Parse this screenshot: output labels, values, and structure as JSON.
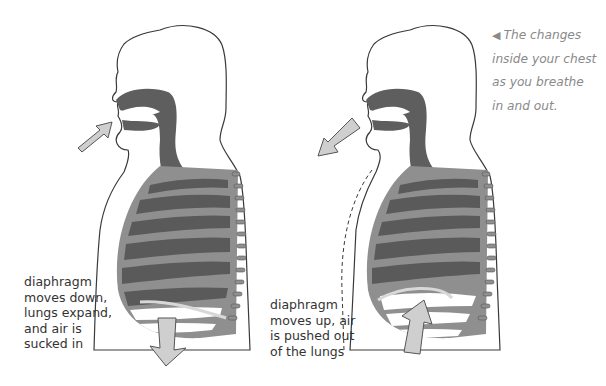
{
  "figure": {
    "caption": {
      "pointer_icon": "◀",
      "lines": [
        "The changes",
        "inside your chest",
        "as you breathe",
        "in and out."
      ]
    },
    "panels": [
      {
        "id": "inhale",
        "label_lines": [
          "diaphragm",
          "moves down,",
          "lungs expand,",
          "and air is",
          "sucked in"
        ],
        "airflow_arrow": "into-mouth",
        "diaphragm_arrow": "down"
      },
      {
        "id": "exhale",
        "label_lines": [
          "diaphragm",
          "moves up, air",
          "is pushed out",
          "of the lungs"
        ],
        "airflow_arrow": "out-of-mouth",
        "diaphragm_arrow": "up"
      }
    ],
    "colors": {
      "outline": "#3a3a3a",
      "airway": "#5e5e5e",
      "ribs": "#8f8f8f",
      "lung": "#5a5a5a",
      "arrow_fill": "#cfcfcf",
      "background": "#ffffff",
      "caption_text": "#8a8a8a",
      "label_text": "#333333"
    }
  }
}
